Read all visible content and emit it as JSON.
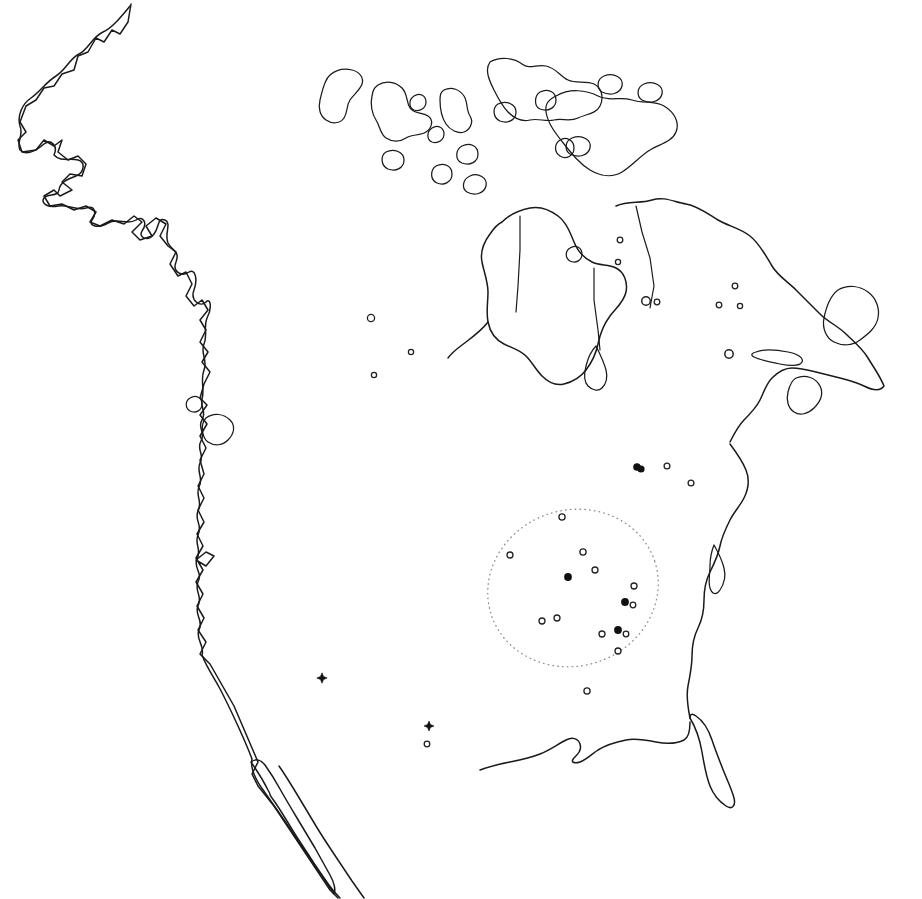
{
  "figure": {
    "kind": "distribution-map",
    "region": "North America",
    "title": "",
    "caption": "",
    "background_color": "#ffffff",
    "outline_color": "#1a1a1a",
    "width": 922,
    "height": 899
  },
  "legend": {
    "present": false,
    "symbol_types": [
      {
        "id": "filled-circle",
        "label": "filled circle",
        "color": "#111111",
        "radius": 3.6
      },
      {
        "id": "open-circle",
        "label": "open circle",
        "color": "#222222",
        "radius": 2.6
      },
      {
        "id": "large-open-circle",
        "label": "large open circle",
        "color": "#222222",
        "radius": 4.2
      },
      {
        "id": "star",
        "label": "star",
        "color": "#111111",
        "radius": 5.0
      }
    ]
  },
  "range_outline": {
    "name": "dotted-range-ellipse",
    "style": "dotted",
    "color": "#8c8c8c",
    "center_x": 573,
    "center_y": 588,
    "radius_x": 86,
    "radius_y": 78,
    "rotation_deg": -18
  },
  "points": [
    {
      "id": "p01",
      "type": "open-circle",
      "x": 371,
      "y": 318,
      "r": 3.6
    },
    {
      "id": "p02",
      "type": "open-circle",
      "x": 411,
      "y": 352,
      "r": 2.6
    },
    {
      "id": "p03",
      "type": "open-circle",
      "x": 374,
      "y": 375,
      "r": 2.6
    },
    {
      "id": "p04",
      "type": "open-circle",
      "x": 620,
      "y": 240,
      "r": 2.8
    },
    {
      "id": "p05",
      "type": "open-circle",
      "x": 618,
      "y": 262,
      "r": 2.6
    },
    {
      "id": "p06",
      "type": "large-open-circle",
      "x": 646,
      "y": 301,
      "r": 4.3
    },
    {
      "id": "p07",
      "type": "open-circle",
      "x": 657,
      "y": 302,
      "r": 2.8
    },
    {
      "id": "p08",
      "type": "open-circle",
      "x": 719,
      "y": 305,
      "r": 2.8
    },
    {
      "id": "p09",
      "type": "open-circle",
      "x": 735,
      "y": 286,
      "r": 2.8
    },
    {
      "id": "p10",
      "type": "open-circle",
      "x": 740,
      "y": 306,
      "r": 2.6
    },
    {
      "id": "p11",
      "type": "large-open-circle",
      "x": 729,
      "y": 354,
      "r": 4.2
    },
    {
      "id": "p12",
      "type": "filled-circle",
      "x": 637,
      "y": 467,
      "r": 3.8
    },
    {
      "id": "p13",
      "type": "filled-circle",
      "x": 641,
      "y": 469,
      "r": 3.6
    },
    {
      "id": "p14",
      "type": "open-circle",
      "x": 667,
      "y": 466,
      "r": 2.9
    },
    {
      "id": "p15",
      "type": "open-circle",
      "x": 691,
      "y": 483,
      "r": 2.9
    },
    {
      "id": "p16",
      "type": "open-circle",
      "x": 562,
      "y": 517,
      "r": 3.1
    },
    {
      "id": "p17",
      "type": "open-circle",
      "x": 510,
      "y": 555,
      "r": 3.0
    },
    {
      "id": "p18",
      "type": "open-circle",
      "x": 583,
      "y": 552,
      "r": 3.1
    },
    {
      "id": "p19",
      "type": "open-circle",
      "x": 595,
      "y": 570,
      "r": 3.0
    },
    {
      "id": "p20",
      "type": "filled-circle",
      "x": 568,
      "y": 577,
      "r": 3.9
    },
    {
      "id": "p21",
      "type": "open-circle",
      "x": 634,
      "y": 586,
      "r": 3.0
    },
    {
      "id": "p22",
      "type": "filled-circle",
      "x": 625,
      "y": 602,
      "r": 3.9
    },
    {
      "id": "p23",
      "type": "open-circle",
      "x": 633,
      "y": 605,
      "r": 2.8
    },
    {
      "id": "p24",
      "type": "open-circle",
      "x": 542,
      "y": 621,
      "r": 3.0
    },
    {
      "id": "p25",
      "type": "open-circle",
      "x": 557,
      "y": 618,
      "r": 3.0
    },
    {
      "id": "p26",
      "type": "open-circle",
      "x": 602,
      "y": 634,
      "r": 3.0
    },
    {
      "id": "p27",
      "type": "filled-circle",
      "x": 618,
      "y": 630,
      "r": 3.9
    },
    {
      "id": "p28",
      "type": "open-circle",
      "x": 626,
      "y": 634,
      "r": 2.8
    },
    {
      "id": "p29",
      "type": "open-circle",
      "x": 618,
      "y": 651,
      "r": 3.0
    },
    {
      "id": "p30",
      "type": "open-circle",
      "x": 587,
      "y": 691,
      "r": 3.1
    },
    {
      "id": "p31",
      "type": "star",
      "x": 322,
      "y": 678,
      "r": 5.2
    },
    {
      "id": "p32",
      "type": "star",
      "x": 429,
      "y": 726,
      "r": 5.0
    },
    {
      "id": "p33",
      "type": "open-circle",
      "x": 427,
      "y": 744,
      "r": 2.8
    }
  ],
  "counts": {
    "total_points": 33,
    "filled_circles": 5,
    "open_circles": 24,
    "large_open_circles": 2,
    "stars": 2
  }
}
